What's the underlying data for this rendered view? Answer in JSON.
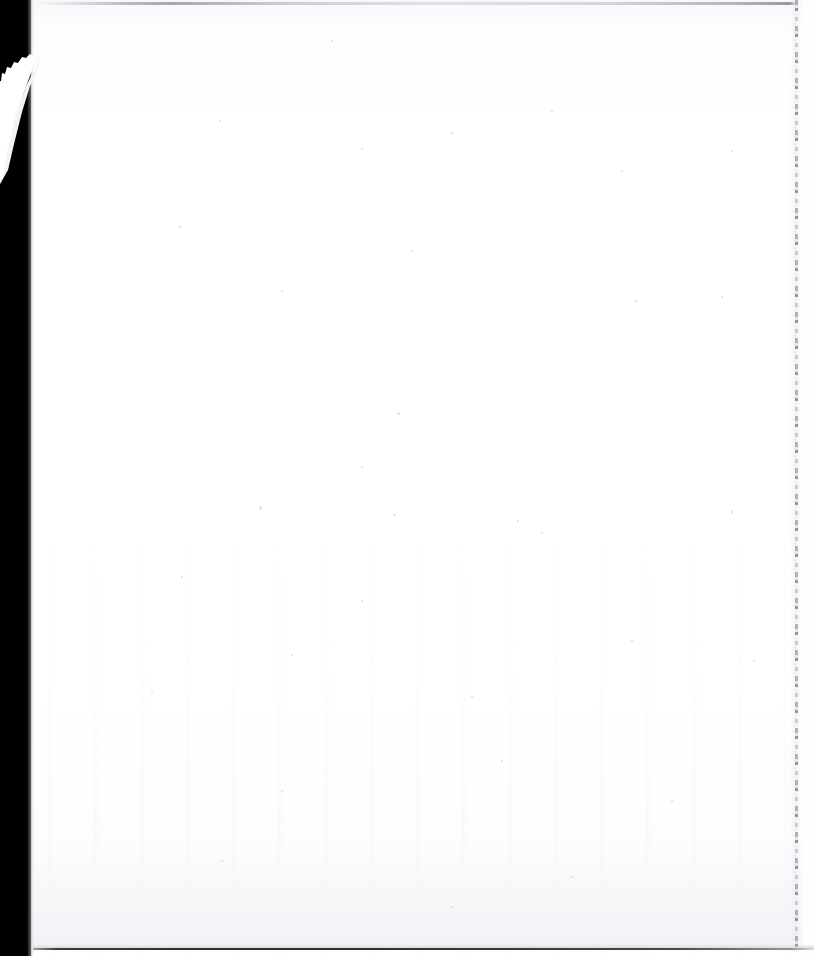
{
  "document": {
    "page_kind": "blank-page",
    "page_text": "",
    "body_text": "",
    "header_text": "",
    "footer_text": "",
    "page_number": "",
    "caption": ""
  },
  "canvas": {
    "width": 814,
    "height": 956,
    "background_color": "#ffffff",
    "paper_color": "#fdfdfe"
  },
  "artifacts": {
    "scanner_band": {
      "name": "scanner-bed-band",
      "color": "#010101",
      "edge": "left",
      "width": 31
    },
    "tear_streak": {
      "name": "diagonal-light-streak",
      "color": "#ffffff",
      "from_x": 30,
      "from_y": 62,
      "to_x": 0,
      "to_y": 178
    },
    "top_rule": {
      "name": "top-edge-rule",
      "color": "#96999f",
      "y": 3,
      "x_start": 34,
      "x_end": 796
    },
    "bottom_rule": {
      "name": "bottom-edge-rule",
      "color": "#2c2e33",
      "y": 949,
      "x_start": 33,
      "x_end": 814
    },
    "crease_line": {
      "name": "right-margin-crease",
      "color": "#96989e",
      "x": 796,
      "style": "broken-dashed",
      "y_start": 0,
      "y_end": 952
    },
    "shading": {
      "name": "roller-shading",
      "color": "#f3f4f8",
      "region": "lower-sheet"
    }
  }
}
